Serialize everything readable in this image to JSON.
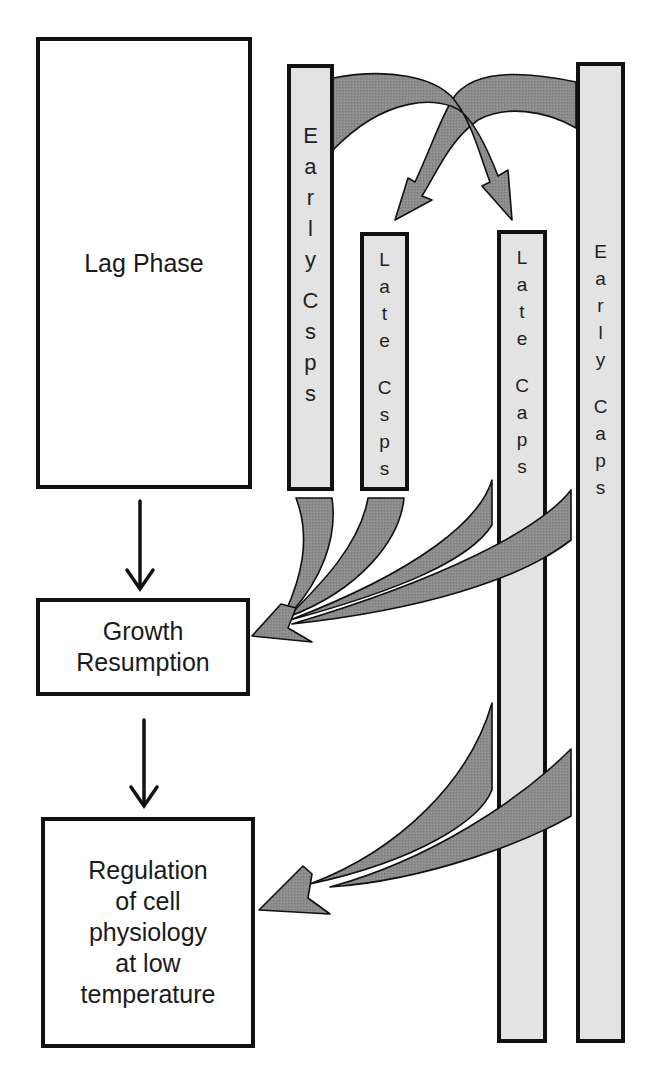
{
  "diagram": {
    "boxes": [
      {
        "id": "lag-phase",
        "label": "Lag Phase"
      },
      {
        "id": "growth-resumption",
        "label": "Growth\nResumption"
      },
      {
        "id": "regulation",
        "label": "Regulation\nof cell\nphysiology\nat low\ntemperature"
      }
    ],
    "bars": [
      {
        "id": "early-csps",
        "label": "Early Csps",
        "letters": [
          "E",
          "a",
          "r",
          "l",
          "y",
          "",
          "C",
          "s",
          "p",
          "s"
        ]
      },
      {
        "id": "late-csps",
        "label": "Late Csps",
        "letters": [
          "L",
          "a",
          "t",
          "e",
          "",
          "C",
          "s",
          "p",
          "s"
        ]
      },
      {
        "id": "late-caps",
        "label": "Late Caps",
        "letters": [
          "L",
          "a",
          "t",
          "e",
          "",
          "C",
          "a",
          "p",
          "s"
        ]
      },
      {
        "id": "early-caps",
        "label": "Early Caps",
        "letters": [
          "E",
          "a",
          "r",
          "l",
          "y",
          "",
          "C",
          "a",
          "p",
          "s"
        ]
      }
    ],
    "edges": [
      {
        "from": "Lag Phase",
        "to": "Growth Resumption",
        "style": "black-arrow"
      },
      {
        "from": "Growth Resumption",
        "to": "Regulation of cell physiology at low temperature",
        "style": "black-arrow"
      },
      {
        "from": "Early Csps",
        "to": "Late Caps",
        "style": "grey-curved-arrow"
      },
      {
        "from": "Early Caps",
        "to": "Late Csps",
        "style": "grey-curved-arrow"
      },
      {
        "from": "Early Csps",
        "to": "Growth Resumption",
        "style": "grey-curved-arrow"
      },
      {
        "from": "Late Csps",
        "to": "Growth Resumption",
        "style": "grey-curved-arrow"
      },
      {
        "from": "Late Caps",
        "to": "Growth Resumption",
        "style": "grey-curved-arrow"
      },
      {
        "from": "Early Caps",
        "to": "Growth Resumption",
        "style": "grey-curved-arrow"
      },
      {
        "from": "Late Caps",
        "to": "Regulation of cell physiology at low temperature",
        "style": "grey-curved-arrow"
      },
      {
        "from": "Early Caps",
        "to": "Regulation of cell physiology at low temperature",
        "style": "grey-curved-arrow"
      }
    ],
    "colors": {
      "border": "#111111",
      "bar_fill": "#e3e3e3",
      "flow_fill": "#8a8a8a",
      "background": "#ffffff"
    }
  }
}
